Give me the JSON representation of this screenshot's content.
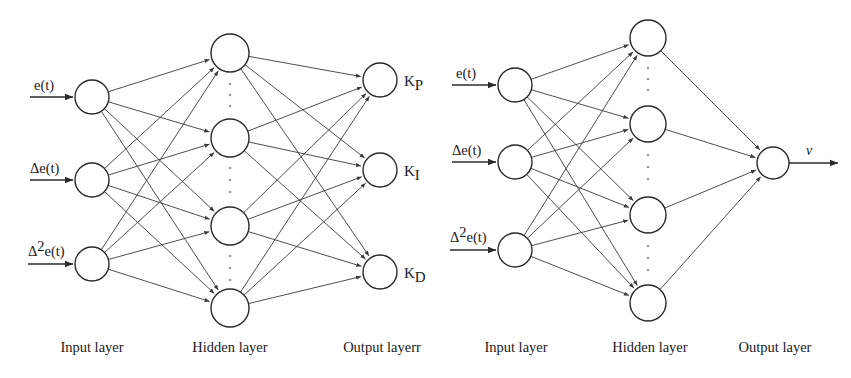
{
  "page": {
    "width": 851,
    "height": 378,
    "background": "#ffffff",
    "stroke_color": "#2b2b2b",
    "edge_color": "#3a3a3a",
    "dot_color": "#9a9a9a"
  },
  "diagrams": [
    {
      "id": "pid-gain-network",
      "caption_row_y": 348,
      "inputs": [
        {
          "label": "e(t)",
          "sup": "",
          "cx": 92,
          "cy": 97,
          "r": 17,
          "line_x1": 30,
          "line_x2": 73,
          "label_x": 34,
          "label_y": 90
        },
        {
          "label": "Δe(t)",
          "sup": "",
          "cx": 92,
          "cy": 180,
          "r": 17,
          "line_x1": 30,
          "line_x2": 73,
          "label_x": 30,
          "label_y": 173
        },
        {
          "label": "Δ",
          "sup": "2",
          "sup_tail": "e(t)",
          "cx": 92,
          "cy": 264,
          "r": 17,
          "line_x1": 28,
          "line_x2": 73,
          "label_x": 28,
          "label_y": 256
        }
      ],
      "hidden": [
        {
          "cx": 230,
          "cy": 53,
          "r": 19
        },
        {
          "cx": 230,
          "cy": 138,
          "r": 19
        },
        {
          "cx": 230,
          "cy": 226,
          "r": 19
        },
        {
          "cx": 230,
          "cy": 308,
          "r": 19
        }
      ],
      "hidden_ellipses": [
        {
          "cx": 230,
          "ys": [
            84,
            95,
            106
          ]
        },
        {
          "cx": 230,
          "ys": [
            168,
            180,
            192
          ]
        },
        {
          "cx": 230,
          "ys": [
            256,
            268,
            280
          ]
        }
      ],
      "outputs": [
        {
          "label": "K",
          "sub": "P",
          "cx": 380,
          "cy": 80,
          "r": 17,
          "label_x": 404,
          "label_y": 86
        },
        {
          "label": "K",
          "sub": "I",
          "cx": 380,
          "cy": 170,
          "r": 17,
          "label_x": 404,
          "label_y": 176
        },
        {
          "label": "K",
          "sub": "D",
          "cx": 380,
          "cy": 272,
          "r": 17,
          "label_x": 404,
          "label_y": 278
        }
      ],
      "layer_labels": [
        {
          "text": "Input layer",
          "x": 92,
          "y": 352
        },
        {
          "text": "Hidden layer",
          "x": 230,
          "y": 352
        },
        {
          "text": "Output layerr",
          "x": 382,
          "y": 352
        }
      ]
    },
    {
      "id": "control-output-network",
      "caption_row_y": 348,
      "inputs": [
        {
          "label": "e(t)",
          "sup": "",
          "cx": 515,
          "cy": 85,
          "r": 17,
          "line_x1": 452,
          "line_x2": 496,
          "label_x": 456,
          "label_y": 78
        },
        {
          "label": "Δe(t)",
          "sup": "",
          "cx": 515,
          "cy": 162,
          "r": 17,
          "line_x1": 452,
          "line_x2": 496,
          "label_x": 452,
          "label_y": 155
        },
        {
          "label": "Δ",
          "sup": "2",
          "sup_tail": "e(t)",
          "cx": 515,
          "cy": 250,
          "r": 17,
          "line_x1": 450,
          "line_x2": 496,
          "label_x": 450,
          "label_y": 242
        }
      ],
      "hidden": [
        {
          "cx": 648,
          "cy": 38,
          "r": 18
        },
        {
          "cx": 648,
          "cy": 124,
          "r": 18
        },
        {
          "cx": 648,
          "cy": 215,
          "r": 18
        },
        {
          "cx": 648,
          "cy": 303,
          "r": 18
        }
      ],
      "hidden_ellipses": [
        {
          "cx": 648,
          "ys": [
            68,
            79,
            90
          ]
        },
        {
          "cx": 648,
          "ys": [
            155,
            167,
            179
          ]
        },
        {
          "cx": 648,
          "ys": [
            246,
            258,
            270
          ]
        }
      ],
      "outputs": [
        {
          "label": "v",
          "sub": "",
          "cx": 773,
          "cy": 163,
          "r": 16,
          "line_x1": 789,
          "line_x2": 838,
          "label_x": 806,
          "label_y": 155
        }
      ],
      "layer_labels": [
        {
          "text": "Input layer",
          "x": 516,
          "y": 352
        },
        {
          "text": "Hidden layer",
          "x": 650,
          "y": 352
        },
        {
          "text": "Output layer",
          "x": 775,
          "y": 352
        }
      ]
    }
  ]
}
